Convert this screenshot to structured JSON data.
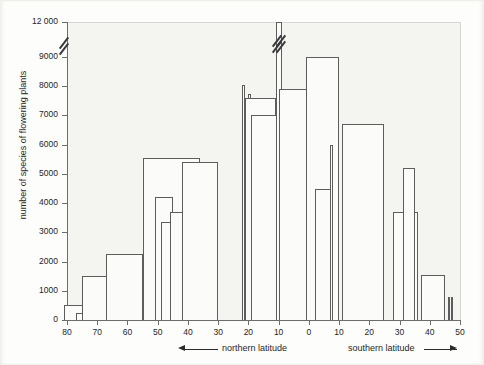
{
  "chart_data": {
    "type": "bar",
    "title": "",
    "xlabel": "latitude",
    "ylabel": "number of species of flowering plants",
    "ylim": [
      0,
      12000
    ],
    "axis_break": {
      "from": 9000,
      "to": 12000,
      "label": "y-axis-break"
    },
    "grid": false,
    "legend": null,
    "y_ticks": [
      0,
      1000,
      2000,
      3000,
      4000,
      5000,
      6000,
      7000,
      8000,
      9000,
      12000
    ],
    "y_tick_labels": [
      "0",
      "1000",
      "2000",
      "3000",
      "4000",
      "5000",
      "6000",
      "7000",
      "8000",
      "9000",
      "12 000"
    ],
    "x_ticks": [
      80,
      70,
      60,
      50,
      40,
      30,
      20,
      10,
      0,
      -10,
      -20,
      -30,
      -40,
      -50
    ],
    "x_tick_labels": [
      "80",
      "70",
      "60",
      "50",
      "40",
      "30",
      "20",
      "10",
      "0",
      "10",
      "20",
      "30",
      "40",
      "50"
    ],
    "x_axis_note": "left half northern latitude (80N to 0), right half southern latitude (0 to 50S)",
    "annotations": [
      {
        "name": "northern-latitude-label",
        "text": "northern latitude",
        "arrow": "left"
      },
      {
        "name": "southern-latitude-label",
        "text": "southern latitude",
        "arrow": "right"
      }
    ],
    "bars": [
      {
        "lat_from": 81,
        "lat_to": 70,
        "value": 530
      },
      {
        "lat_from": 77,
        "lat_to": 71,
        "value": 250
      },
      {
        "lat_from": 66,
        "lat_to": 61,
        "value": 580
      },
      {
        "lat_from": 63,
        "lat_to": 60,
        "value": 500
      },
      {
        "lat_from": 75,
        "lat_to": 55,
        "value": 1520
      },
      {
        "lat_from": 67,
        "lat_to": 55,
        "value": 2250
      },
      {
        "lat_from": 55,
        "lat_to": 43,
        "value": 2330
      },
      {
        "lat_from": 55,
        "lat_to": 36,
        "value": 5550
      },
      {
        "lat_from": 51,
        "lat_to": 49,
        "value": 3100
      },
      {
        "lat_from": 51,
        "lat_to": 45,
        "value": 4200
      },
      {
        "lat_from": 49,
        "lat_to": 44,
        "value": 3350
      },
      {
        "lat_from": 46,
        "lat_to": 30,
        "value": 3700
      },
      {
        "lat_from": 42,
        "lat_to": 30,
        "value": 5400
      },
      {
        "lat_from": 22,
        "lat_to": 21,
        "value": 8050
      },
      {
        "lat_from": 20,
        "lat_to": 19,
        "value": 7750
      },
      {
        "lat_from": 21,
        "lat_to": 11,
        "value": 7600
      },
      {
        "lat_from": 19,
        "lat_to": 1,
        "value": 7000
      },
      {
        "lat_from": 11,
        "lat_to": 9,
        "value": 12000
      },
      {
        "lat_from": 10,
        "lat_to": -1,
        "value": 7900
      },
      {
        "lat_from": 1,
        "lat_to": -10,
        "value": 9000
      },
      {
        "lat_from": -2,
        "lat_to": -8,
        "value": 4500
      },
      {
        "lat_from": -7,
        "lat_to": -8,
        "value": 6000
      },
      {
        "lat_from": -11,
        "lat_to": -25,
        "value": 6700
      },
      {
        "lat_from": -28,
        "lat_to": -36,
        "value": 3700
      },
      {
        "lat_from": -31,
        "lat_to": -35,
        "value": 5200
      },
      {
        "lat_from": -37,
        "lat_to": -45,
        "value": 1550
      },
      {
        "lat_from": -46,
        "lat_to": -46.5,
        "value": 800
      },
      {
        "lat_from": -47,
        "lat_to": -47.5,
        "value": 780
      }
    ]
  },
  "style": {
    "bar_stroke": "#5d5d5d",
    "axis_color": "#6d6d6d",
    "plot_background": "#f4f4f1",
    "page_background": "#fdfdfc",
    "text_color": "#1f1f1f"
  }
}
